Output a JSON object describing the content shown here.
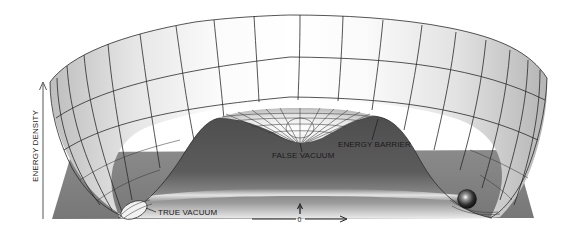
{
  "diagram": {
    "type": "energy-potential-surface",
    "y_axis": {
      "label": "ENERGY DENSITY",
      "direction": "up-arrow"
    },
    "x_axis": {
      "origin_label": "0",
      "direction": "right-arrow"
    },
    "annotations": {
      "true_vacuum": "TRUE VACUUM",
      "false_vacuum": "FALSE VACUUM",
      "energy_barrier": "ENERGY BARRIER"
    },
    "elements": [
      {
        "name": "outer-bowl-surface",
        "description": "wireframe bowl rising at edges"
      },
      {
        "name": "central-hump",
        "description": "raised barrier ring around central dip"
      },
      {
        "name": "false-vacuum-dip",
        "description": "local minimum at center"
      },
      {
        "name": "true-vacuum-trough",
        "description": "global minimum ring at bottom"
      },
      {
        "name": "ball",
        "description": "sphere resting in true vacuum trough"
      },
      {
        "name": "ground-plane",
        "description": "grey base plane"
      }
    ],
    "colors": {
      "plane": "#7d7d7d",
      "hump_dark": "#5a5a5a",
      "surface_light": "#f4f4f4",
      "gridline": "#2a2a2a",
      "text": "#1a1a1a"
    }
  }
}
